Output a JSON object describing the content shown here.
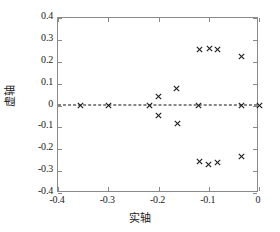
{
  "chart_data": {
    "type": "scatter",
    "title": "",
    "xlabel": "实轴",
    "ylabel": "虚轴",
    "xlim": [
      -0.4,
      0.0
    ],
    "ylim": [
      -0.4,
      0.4
    ],
    "xticks": [
      -0.4,
      -0.3,
      -0.2,
      -0.1,
      0
    ],
    "yticks": [
      0.4,
      0.3,
      0.2,
      0.1,
      0,
      -0.1,
      -0.2,
      -0.3,
      -0.4
    ],
    "xticklabels": [
      "-0.4",
      "-0.3",
      "-0.2",
      "-0.1",
      "0"
    ],
    "yticklabels": [
      "0.4",
      "0.3",
      "0.2",
      "0.1",
      "0",
      "-0.1",
      "-0.2",
      "-0.3",
      "-0.4"
    ],
    "grid": false,
    "legend": null,
    "marker": "x",
    "marker_color": "#1a1a1a",
    "reference_line": {
      "orientation": "horizontal",
      "value": 0,
      "style": "dashed",
      "color": "#111111"
    },
    "series": [
      {
        "name": "poles",
        "marker": "x",
        "points": [
          {
            "x": -0.355,
            "y": 0.0
          },
          {
            "x": -0.3,
            "y": 0.0
          },
          {
            "x": -0.218,
            "y": 0.0
          },
          {
            "x": -0.12,
            "y": 0.0
          },
          {
            "x": -0.035,
            "y": 0.0
          },
          {
            "x": 0.0,
            "y": 0.0
          },
          {
            "x": -0.2,
            "y": 0.04
          },
          {
            "x": -0.165,
            "y": 0.078
          },
          {
            "x": -0.2,
            "y": -0.045
          },
          {
            "x": -0.163,
            "y": -0.08
          },
          {
            "x": -0.118,
            "y": 0.256
          },
          {
            "x": -0.098,
            "y": 0.262
          },
          {
            "x": -0.083,
            "y": 0.255
          },
          {
            "x": -0.035,
            "y": 0.225
          },
          {
            "x": -0.118,
            "y": -0.258
          },
          {
            "x": -0.1,
            "y": -0.268
          },
          {
            "x": -0.083,
            "y": -0.259
          },
          {
            "x": -0.035,
            "y": -0.232
          }
        ]
      }
    ]
  }
}
